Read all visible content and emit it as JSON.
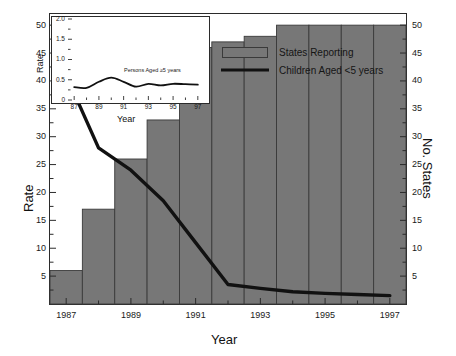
{
  "chart_data": {
    "type": "bar",
    "title": "",
    "xlabel": "Year",
    "ylabel": "Rate",
    "y2label": "No. States",
    "categories": [
      1987,
      1988,
      1989,
      1990,
      1991,
      1992,
      1993,
      1994,
      1995,
      1996,
      1997
    ],
    "xlim": [
      1986.5,
      1997.5
    ],
    "ylim": [
      0,
      52
    ],
    "y2lim": [
      0,
      52
    ],
    "grid": false,
    "legend_position": "top-right",
    "y_ticks": [
      5,
      10,
      15,
      20,
      25,
      30,
      35,
      40,
      45,
      50
    ],
    "y_tick_labels": [
      "5",
      "10",
      "15",
      "20",
      "25",
      "30",
      "35",
      "40",
      "45",
      "50"
    ],
    "y2_ticks": [
      5,
      10,
      15,
      20,
      25,
      30,
      35,
      40,
      45,
      50
    ],
    "y2_tick_labels": [
      "5",
      "10",
      "15",
      "20",
      "25",
      "30",
      "35",
      "40",
      "45",
      "50"
    ],
    "x_ticks": [
      1987,
      1989,
      1991,
      1993,
      1995,
      1997
    ],
    "x_tick_labels": [
      "1987",
      "1989",
      "1991",
      "1993",
      "1995",
      "1997"
    ],
    "x_minor_ticks": [
      1988,
      1990,
      1992,
      1994,
      1996
    ],
    "series": [
      {
        "name": "States Reporting",
        "type": "bar",
        "axis": "right",
        "color": "#777777",
        "edge_color": "#3a3a3a",
        "x": [
          1987,
          1988,
          1989,
          1990,
          1991,
          1992,
          1993,
          1994,
          1995,
          1996,
          1997
        ],
        "values": [
          6,
          17,
          26,
          33,
          46,
          47,
          48,
          50,
          50,
          50,
          50
        ]
      },
      {
        "name": "Children Aged <5 years",
        "type": "line",
        "axis": "left",
        "color": "#111111",
        "x": [
          1987,
          1988,
          1989,
          1990,
          1991,
          1992,
          1993,
          1994,
          1995,
          1996,
          1997
        ],
        "values": [
          41.0,
          28.0,
          24.0,
          18.5,
          11.0,
          3.5,
          2.8,
          2.2,
          1.9,
          1.7,
          1.5
        ]
      }
    ],
    "inset": {
      "type": "line",
      "xlabel": "Year",
      "ylabel": "Rate",
      "xlim": [
        86.5,
        97.5
      ],
      "ylim": [
        0,
        2.0
      ],
      "grid": false,
      "y_ticks": [
        0,
        0.5,
        1.0,
        1.5,
        2.0
      ],
      "y_tick_labels": [
        "0",
        "0.5",
        "1.0",
        "1.5",
        "2.0"
      ],
      "x_ticks": [
        87,
        89,
        91,
        93,
        95,
        97
      ],
      "x_tick_labels": [
        "87",
        "89",
        "91",
        "93",
        "95",
        "97"
      ],
      "x_minor_ticks": [
        88,
        90,
        92,
        94,
        96
      ],
      "annotation": "Persons Aged ≥5 years",
      "series": [
        {
          "name": "Persons Aged ≥5 years",
          "color": "#111111",
          "x": [
            87,
            88,
            89,
            90,
            91,
            92,
            93,
            94,
            95,
            96,
            97
          ],
          "values": [
            0.32,
            0.3,
            0.45,
            0.55,
            0.45,
            0.33,
            0.4,
            0.36,
            0.4,
            0.39,
            0.38
          ]
        }
      ]
    }
  },
  "legend": {
    "items": [
      {
        "label": "States Reporting",
        "marker": "bar-swatch",
        "color": "#777777"
      },
      {
        "label": "Children Aged <5 years",
        "marker": "line",
        "color": "#111111"
      }
    ]
  },
  "axes": {
    "left_title": "Rate",
    "right_title": "No. States",
    "bottom_title": "Year"
  },
  "inset_axes": {
    "left_title": "Rate",
    "bottom_title": "Year"
  }
}
